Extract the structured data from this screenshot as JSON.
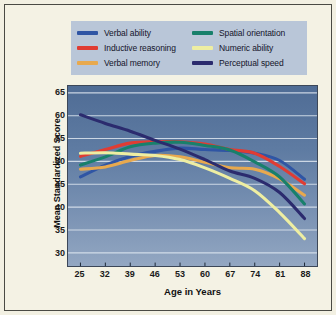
{
  "figure": {
    "background_color": "#f4f2e4",
    "frame_color": "#4a4a44"
  },
  "chart_data": {
    "type": "line",
    "title": "",
    "xlabel": "Age in Years",
    "ylabel": "Mean Standardized Score",
    "x": [
      25,
      32,
      39,
      46,
      53,
      60,
      67,
      74,
      81,
      88
    ],
    "xtick_labels": [
      "25",
      "32",
      "39",
      "46",
      "53",
      "60",
      "67",
      "74",
      "81",
      "88"
    ],
    "ytick_labels": [
      "65",
      "60",
      "55",
      "50",
      "45",
      "40",
      "35",
      "30"
    ],
    "ytick_values": [
      65,
      60,
      55,
      50,
      45,
      40,
      35,
      30
    ],
    "xlim": [
      21.5,
      91.5
    ],
    "ylim": [
      27.0,
      66.5
    ],
    "grid": "horizontal",
    "grid_color": "#dfe7f0",
    "plot_background": "#5e7ba2",
    "legend_position": "above-plot",
    "series": [
      {
        "name": "Verbal ability",
        "color": "#2f55a4",
        "values": [
          46.6,
          49.2,
          51.1,
          52.2,
          52.9,
          52.6,
          52.4,
          51.8,
          50.2,
          46.1
        ]
      },
      {
        "name": "Inductive reasoning",
        "color": "#e03c33",
        "values": [
          51.1,
          52.6,
          54.0,
          54.3,
          54.3,
          53.8,
          52.6,
          51.8,
          48.9,
          45.1
        ]
      },
      {
        "name": "Verbal memory",
        "color": "#e8a94e",
        "values": [
          48.3,
          48.8,
          50.2,
          51.3,
          51.0,
          49.8,
          48.6,
          48.3,
          46.2,
          42.6
        ]
      },
      {
        "name": "Spatial orientation",
        "color": "#18806b",
        "values": [
          49.2,
          51.0,
          53.2,
          54.0,
          54.2,
          53.5,
          52.5,
          49.9,
          46.6,
          40.7
        ]
      },
      {
        "name": "Numeric ability",
        "color": "#eeeea2",
        "values": [
          51.8,
          51.9,
          51.6,
          51.3,
          50.4,
          48.6,
          46.3,
          43.6,
          38.8,
          33.1
        ]
      },
      {
        "name": "Perceptual speed",
        "color": "#2b2b6e",
        "values": [
          60.2,
          58.3,
          56.6,
          54.6,
          52.7,
          50.4,
          47.9,
          46.3,
          43.2,
          37.5
        ]
      }
    ]
  },
  "legend": {
    "background_color": "#b9c6d8",
    "entries": [
      {
        "label": "Verbal ability",
        "color": "#2f55a4"
      },
      {
        "label": "Spatial orientation",
        "color": "#18806b"
      },
      {
        "label": "Inductive reasoning",
        "color": "#e03c33"
      },
      {
        "label": "Numeric ability",
        "color": "#eeeea2"
      },
      {
        "label": "Verbal memory",
        "color": "#e8a94e"
      },
      {
        "label": "Perceptual speed",
        "color": "#2b2b6e"
      }
    ]
  }
}
